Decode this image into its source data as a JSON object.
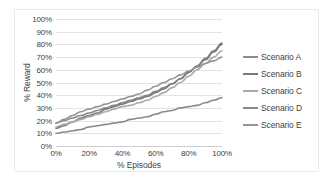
{
  "chart_data": {
    "type": "line",
    "title": "",
    "xlabel": "% Episodes",
    "ylabel": "% Reward",
    "xlim": [
      0,
      100
    ],
    "ylim": [
      0,
      100
    ],
    "grid": "horizontal",
    "legend_position": "right",
    "x_ticks": [
      "0%",
      "20%",
      "40%",
      "60%",
      "80%",
      "100%"
    ],
    "x_tick_values": [
      0,
      20,
      40,
      60,
      80,
      100
    ],
    "y_ticks": [
      "0%",
      "10%",
      "20%",
      "30%",
      "40%",
      "50%",
      "60%",
      "70%",
      "80%",
      "90%",
      "100%"
    ],
    "y_tick_values": [
      0,
      10,
      20,
      30,
      40,
      50,
      60,
      70,
      80,
      90,
      100
    ],
    "x": [
      0,
      5,
      10,
      15,
      20,
      25,
      30,
      35,
      40,
      45,
      50,
      55,
      60,
      65,
      70,
      75,
      80,
      85,
      90,
      95,
      100
    ],
    "series": [
      {
        "name": "Scenario A",
        "color": "#8c8c8c",
        "values": [
          18,
          20,
          22,
          24,
          26,
          28,
          30,
          32,
          34,
          36,
          38,
          40,
          43,
          46,
          49,
          53,
          58,
          63,
          69,
          75,
          81
        ]
      },
      {
        "name": "Scenario B",
        "color": "#7a7a7a",
        "values": [
          14,
          16,
          19,
          22,
          24,
          26,
          29,
          31,
          33,
          35,
          37,
          39,
          42,
          45,
          49,
          53,
          58,
          63,
          68,
          74,
          80
        ]
      },
      {
        "name": "Scenario C",
        "color": "#a8a8a8",
        "values": [
          15,
          17,
          19,
          21,
          23,
          25,
          27,
          29,
          31,
          32,
          34,
          36,
          39,
          42,
          46,
          50,
          55,
          60,
          65,
          70,
          75
        ]
      },
      {
        "name": "Scenario D",
        "color": "#8a8a8a",
        "values": [
          10,
          11,
          12,
          13,
          15,
          16,
          17,
          18,
          19,
          21,
          22,
          23,
          25,
          27,
          28,
          30,
          31,
          32,
          34,
          36,
          38
        ]
      },
      {
        "name": "Scenario E",
        "color": "#959595",
        "values": [
          18,
          21,
          24,
          27,
          29,
          31,
          33,
          35,
          37,
          39,
          41,
          44,
          47,
          50,
          53,
          56,
          59,
          62,
          65,
          67,
          70
        ]
      }
    ]
  },
  "legend": {
    "items": [
      {
        "label": "Scenario A",
        "color": "#8c8c8c"
      },
      {
        "label": "Scenario B",
        "color": "#7a7a7a"
      },
      {
        "label": "Scenario C",
        "color": "#a8a8a8"
      },
      {
        "label": "Scenario D",
        "color": "#8a8a8a"
      },
      {
        "label": "Scenario E",
        "color": "#959595"
      }
    ]
  }
}
